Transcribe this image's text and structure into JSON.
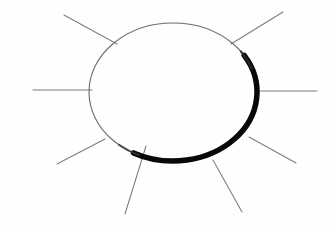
{
  "figure": {
    "title": "Hand-drawn sun",
    "width": 329,
    "height": 231,
    "background_color": "#fefefe",
    "ray_color": "#7d7d7d",
    "outline_thin_color": "#6b6b6b",
    "outline_thick_color": "#080808"
  },
  "chart_data": {
    "type": "diagram",
    "title": "Hand-drawn sun",
    "shapes": [
      {
        "name": "sun-body-ellipse",
        "kind": "ellipse",
        "center_x": 173,
        "center_y": 92,
        "radius_x": 84,
        "radius_y": 69,
        "fill": "none",
        "thin_stroke_width": 1.1,
        "thick_stroke_width": 5.5,
        "thick_arc_start_deg": 328,
        "thick_arc_end_deg": 118,
        "note": "Outline is faint grey along the upper-left and heavy black along the lower-right, as if shaded."
      }
    ],
    "rays": [
      {
        "name": "ray-west",
        "x1": 33,
        "y1": 90,
        "x2": 92,
        "y2": 90,
        "angle_deg": 180
      },
      {
        "name": "ray-northwest",
        "x1": 64,
        "y1": 15,
        "x2": 117,
        "y2": 44,
        "angle_deg": 151
      },
      {
        "name": "ray-northeast",
        "x1": 283,
        "y1": 12,
        "x2": 231,
        "y2": 44,
        "angle_deg": 32
      },
      {
        "name": "ray-east",
        "x1": 317,
        "y1": 91,
        "x2": 258,
        "y2": 91,
        "angle_deg": 0
      },
      {
        "name": "ray-southeast-upper",
        "x1": 296,
        "y1": 163,
        "x2": 249,
        "y2": 137,
        "angle_deg": 331
      },
      {
        "name": "ray-southeast-lower",
        "x1": 242,
        "y1": 212,
        "x2": 213,
        "y2": 160,
        "angle_deg": 299
      },
      {
        "name": "ray-southwest-lower",
        "x1": 125,
        "y1": 214,
        "x2": 146,
        "y2": 146,
        "angle_deg": 253
      },
      {
        "name": "ray-southwest-upper",
        "x1": 57,
        "y1": 164,
        "x2": 105,
        "y2": 139,
        "angle_deg": 207
      }
    ],
    "ray_count": 8,
    "xlabel": "",
    "ylabel": "",
    "legend": [],
    "grid": false
  }
}
